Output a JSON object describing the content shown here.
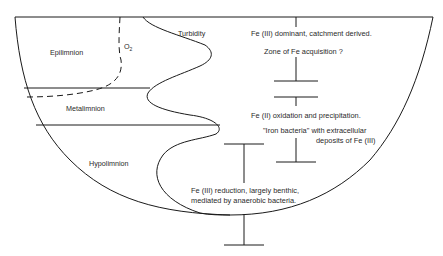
{
  "layers": {
    "epilimnion": "Epilimnion",
    "metalimnion": "Metalimnion",
    "hypolimnion": "Hypolimnion"
  },
  "profiles": {
    "oxygen": "O",
    "oxygen_sub": "2",
    "turbidity": "Turbidity"
  },
  "zones": {
    "upper": {
      "line1": "Fe (III) dominant, catchment derived.",
      "line2": "Zone of Fe acquisition ?"
    },
    "middle": {
      "line1": "Fe (II) oxidation and precipitation.",
      "line2": "\"Iron bacteria\" with extracellular",
      "line3": "deposits of Fe (III)"
    },
    "lower": {
      "line1": "Fe (III) reduction, largely benthic,",
      "line2": "mediated by anaerobic bacteria."
    }
  },
  "colors": {
    "line": "#1a1a1a",
    "text": "#2a2a2a",
    "background": "#ffffff"
  }
}
